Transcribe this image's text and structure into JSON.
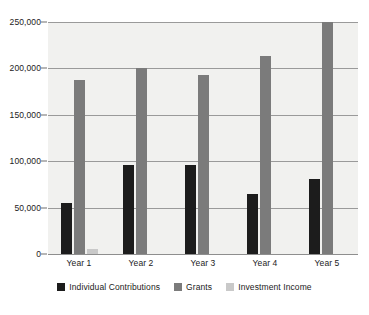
{
  "chart_data": {
    "type": "bar",
    "title": "",
    "subtitle": "",
    "xlabel": "",
    "ylabel": "",
    "categories": [
      "Year 1",
      "Year 2",
      "Year 3",
      "Year 4",
      "Year 5"
    ],
    "series": [
      {
        "name": "Individual Contributions",
        "color": "#1c1c1c",
        "values": [
          55000,
          96000,
          96000,
          65000,
          81000
        ]
      },
      {
        "name": "Grants",
        "color": "#7b7b7b",
        "values": [
          187000,
          200000,
          193000,
          213000,
          250000
        ]
      },
      {
        "name": "Investment Income",
        "color": "#c9c9c9",
        "values": [
          5000,
          0,
          0,
          0,
          0
        ]
      }
    ],
    "ylim": [
      0,
      250000
    ],
    "ytick_values": [
      0,
      50000,
      100000,
      150000,
      200000,
      250000
    ],
    "ytick_labels": [
      "0",
      "50,000",
      "100,000",
      "150,000",
      "200,000",
      "250,000"
    ],
    "grid": true,
    "legend_position": "bottom",
    "plot_background": "#f1f1ef",
    "page_background": "#ffffff",
    "gridline_color": "#9a9a9a"
  }
}
